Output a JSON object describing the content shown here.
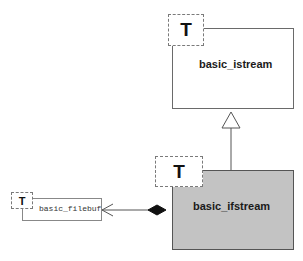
{
  "diagram": {
    "type": "UML class diagram",
    "classes": [
      {
        "id": "basic_istream",
        "name": "basic_istream",
        "template_param": "T",
        "highlighted": false
      },
      {
        "id": "basic_ifstream",
        "name": "basic_ifstream",
        "template_param": "T",
        "highlighted": true
      },
      {
        "id": "basic_filebuf",
        "name": "basic_filebuf",
        "template_param": "T",
        "highlighted": false
      }
    ],
    "relationships": [
      {
        "type": "inheritance",
        "from": "basic_ifstream",
        "to": "basic_istream"
      },
      {
        "type": "composition",
        "from": "basic_ifstream",
        "to": "basic_filebuf"
      }
    ],
    "colors": {
      "highlight_fill": "#c3c3c3",
      "border": "#6a6a6a",
      "dashed_border": "#7a7a7a",
      "text": "#1a1a1a"
    }
  }
}
